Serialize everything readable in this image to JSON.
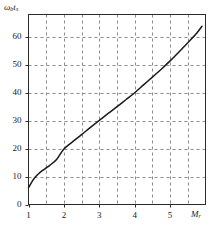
{
  "chart_data": {
    "type": "line",
    "title": "",
    "subtitle": "",
    "xlabel": "M_r",
    "ylabel": "omega_b t_s",
    "xlabel_base": "M",
    "xlabel_sub": "r",
    "ylabel_omega": "ω",
    "ylabel_sub1": "b",
    "ylabel_base2": "t",
    "ylabel_sub2": "s",
    "xlim": [
      1,
      6
    ],
    "ylim": [
      0,
      68
    ],
    "xticks": [
      1,
      2,
      3,
      4,
      5
    ],
    "xtick_labels": [
      "1",
      "2",
      "3",
      "4",
      "5"
    ],
    "yticks": [
      0,
      10,
      20,
      30,
      40,
      50,
      60
    ],
    "ytick_labels": [
      "0",
      "10",
      "20",
      "30",
      "40",
      "50",
      "60"
    ],
    "grid": true,
    "grid_style": "dashed",
    "grid_x_step": 0.5,
    "grid_y_step": 10,
    "legend": null,
    "series": [
      {
        "name": "bandwidth-settling-time",
        "x": [
          1.0,
          1.1,
          1.2,
          1.3,
          1.4,
          1.5,
          1.6,
          1.8,
          2.0,
          2.25,
          2.5,
          2.75,
          3.0,
          3.25,
          3.5,
          3.75,
          4.0,
          4.25,
          4.5,
          4.75,
          5.0,
          5.25,
          5.5,
          5.75,
          5.9
        ],
        "y": [
          6.0,
          8.2,
          9.9,
          11.2,
          12.2,
          13.1,
          14.0,
          16.2,
          19.9,
          22.5,
          25.0,
          27.6,
          30.1,
          32.6,
          35.0,
          37.5,
          40.0,
          42.8,
          45.6,
          48.4,
          51.4,
          54.6,
          57.9,
          61.3,
          63.8
        ]
      }
    ],
    "colors": {
      "curve": "#1a1a1a",
      "frame": "#2b2b2b",
      "grid": "#8d8d8d",
      "text": "#1a1a1a",
      "background": "#ffffff"
    }
  }
}
